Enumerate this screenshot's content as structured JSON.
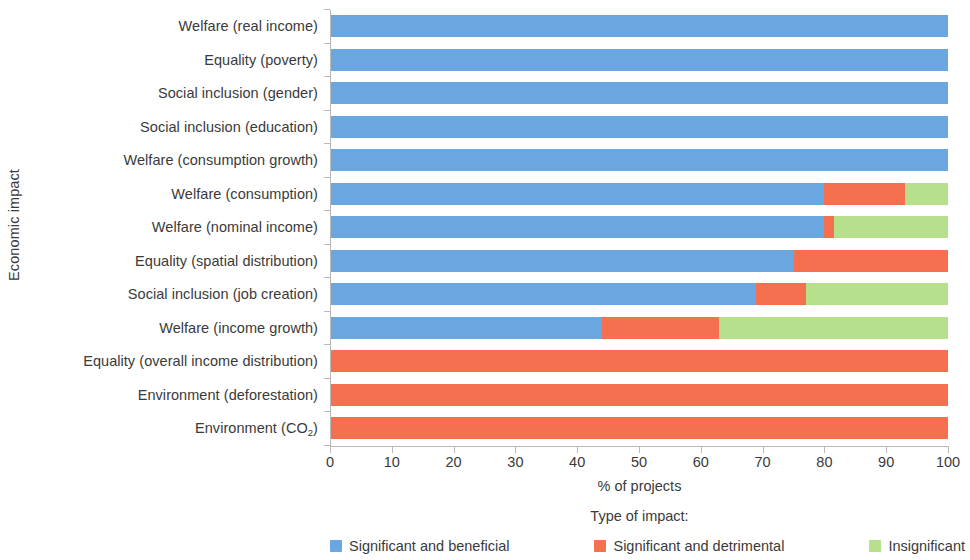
{
  "chart_data": {
    "type": "bar",
    "orientation": "horizontal",
    "stacked": true,
    "stack_mode": "percent",
    "title": "",
    "xlabel": "% of projects",
    "ylabel": "Economic impact",
    "xlim": [
      0,
      100
    ],
    "xticks": [
      0,
      10,
      20,
      30,
      40,
      50,
      60,
      70,
      80,
      90,
      100
    ],
    "xtick_labels": [
      "0",
      "10",
      "20",
      "30",
      "40",
      "50",
      "60",
      "70",
      "80",
      "90",
      "100"
    ],
    "grid": false,
    "legend_title": "Type of impact:",
    "legend_position": "bottom",
    "categories": [
      "Welfare (real income)",
      "Equality (poverty)",
      "Social inclusion (gender)",
      "Social inclusion (education)",
      "Welfare (consumption growth)",
      "Welfare (consumption)",
      "Welfare (nominal income)",
      "Equality (spatial distribution)",
      "Social inclusion (job creation)",
      "Welfare (income growth)",
      "Equality (overall income distribution)",
      "Environment (deforestation)",
      "Environment (CO2)"
    ],
    "category_labels_html": [
      "Welfare (real income)",
      "Equality (poverty)",
      "Social inclusion (gender)",
      "Social inclusion (education)",
      "Welfare (consumption growth)",
      "Welfare (consumption)",
      "Welfare (nominal income)",
      "Equality (spatial distribution)",
      "Social inclusion (job creation)",
      "Welfare (income growth)",
      "Equality (overall income distribution)",
      "Environment (deforestation)",
      "Environment (CO<sub>2</sub>)"
    ],
    "series": [
      {
        "name": "Significant and beneficial",
        "color": "#6aa6e0",
        "values": [
          100,
          100,
          100,
          100,
          100,
          80,
          80,
          75,
          69,
          44,
          0,
          0,
          0
        ]
      },
      {
        "name": "Significant and detrimental",
        "color": "#f4704f",
        "values": [
          0,
          0,
          0,
          0,
          0,
          13,
          1.5,
          25,
          8,
          19,
          100,
          100,
          100
        ]
      },
      {
        "name": "Insignificant",
        "color": "#b6e08c",
        "values": [
          0,
          0,
          0,
          0,
          0,
          7,
          18.5,
          0,
          23,
          37,
          0,
          0,
          0
        ]
      }
    ]
  },
  "legend": {
    "title": "Type of impact:",
    "items": [
      {
        "label": "Significant and beneficial",
        "color": "#6aa6e0",
        "icon": "legend-swatch-icon"
      },
      {
        "label": "Significant and detrimental",
        "color": "#f4704f",
        "icon": "legend-swatch-icon"
      },
      {
        "label": "Insignificant",
        "color": "#b6e08c",
        "icon": "legend-swatch-icon"
      }
    ]
  },
  "axes": {
    "x_title": "% of projects",
    "y_title": "Economic impact"
  }
}
